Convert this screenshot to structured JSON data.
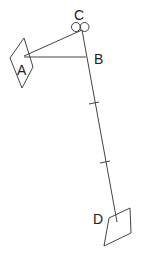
{
  "diagram": {
    "labels": {
      "A": "A",
      "B": "B",
      "C": "C",
      "D": "D"
    },
    "colors": {
      "line": "#444444",
      "text": "#222222",
      "background": "#ffffff"
    }
  }
}
